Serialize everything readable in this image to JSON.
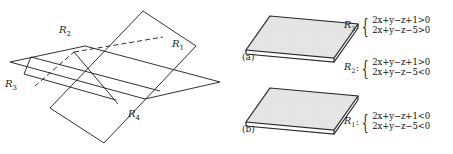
{
  "figure": {
    "diagram": {
      "name": "two-intersecting-planes",
      "region_labels": [
        {
          "id": "R1",
          "text": "R",
          "sub": "1",
          "x": 172,
          "y": 44
        },
        {
          "id": "R2",
          "text": "R",
          "sub": "2",
          "x": 59,
          "y": 29
        },
        {
          "id": "R3",
          "text": "R",
          "sub": "3",
          "x": 7,
          "y": 83
        },
        {
          "id": "R4",
          "text": "R",
          "sub": "4",
          "x": 129,
          "y": 113
        }
      ]
    },
    "panels": [
      {
        "caption": "(a)",
        "slab_name": "shaded-slab-a",
        "equations": [
          {
            "label": "R",
            "sub": "3",
            "lines": [
              "2x+y−z+1>0",
              "2x+y−z−5>0"
            ]
          }
        ]
      },
      {
        "caption": "(b)",
        "slab_name": "shaded-slab-b",
        "equations": [
          {
            "label": "R",
            "sub": "2",
            "lines": [
              "2x+y−z+1>0",
              "2x+y−z−5<0"
            ]
          },
          {
            "label": "R",
            "sub": "1",
            "lines": [
              "2x+y−z+1<0",
              "2x+y−z−5<0"
            ]
          }
        ]
      }
    ],
    "colors": {
      "stroke": "#1a1a1a",
      "slab_fill": "#e3e3e3",
      "slab_edge": "#2b2b2b",
      "text": "#111111"
    }
  }
}
